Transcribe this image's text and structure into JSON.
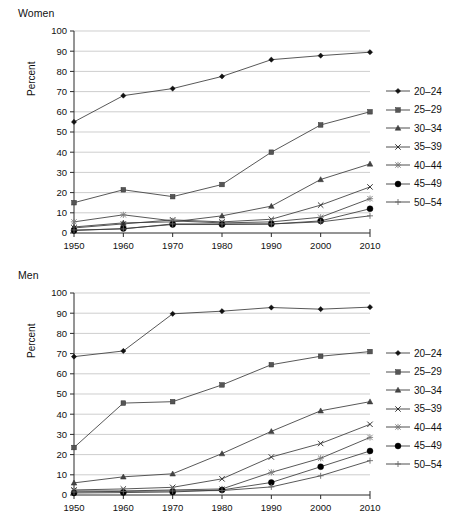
{
  "figure": {
    "background": "#ffffff",
    "line_color": "#3a3a3a",
    "grid_color": "#b9b9b9",
    "axis_color": "#2a2a2a"
  },
  "panels": [
    {
      "id": "women",
      "title": "Women",
      "chart_data": {
        "type": "line",
        "title": "Women",
        "xlabel": "",
        "ylabel": "Percent",
        "categories": [
          1950,
          1960,
          1970,
          1980,
          1990,
          2000,
          2010
        ],
        "xtick_labels": [
          "1950",
          "1960",
          "1970",
          "1980",
          "1990",
          "2000",
          "2010"
        ],
        "ytick_labels": [
          "0",
          "10",
          "20",
          "30",
          "40",
          "50",
          "60",
          "70",
          "80",
          "90",
          "100"
        ],
        "ylim": [
          0,
          100
        ],
        "ytick_step": 10,
        "grid": "horizontal",
        "legend_position": "right",
        "series": [
          {
            "name": "20–24",
            "marker": "diamond",
            "values": [
              55.0,
              68.0,
              71.5,
              77.5,
              85.8,
              87.8,
              89.5
            ]
          },
          {
            "name": "25–29",
            "marker": "square",
            "values": [
              15.0,
              21.4,
              18.0,
              24.0,
              40.0,
              53.5,
              60.0
            ]
          },
          {
            "name": "30–34",
            "marker": "triangle",
            "values": [
              3.0,
              5.0,
              5.5,
              8.5,
              13.3,
              26.5,
              34.2
            ]
          },
          {
            "name": "35–39",
            "marker": "cross",
            "values": [
              2.5,
              4.5,
              6.5,
              5.5,
              6.8,
              13.8,
              22.8
            ]
          },
          {
            "name": "40–44",
            "marker": "star",
            "values": [
              5.5,
              9.0,
              6.0,
              5.0,
              5.5,
              7.8,
              17.0
            ]
          },
          {
            "name": "45–49",
            "marker": "circle",
            "values": [
              1.2,
              2.2,
              4.2,
              4.2,
              4.4,
              6.0,
              12.0
            ]
          },
          {
            "name": "50–54",
            "marker": "plus",
            "values": [
              1.5,
              2.0,
              4.5,
              4.5,
              4.5,
              5.5,
              8.5
            ]
          }
        ]
      }
    },
    {
      "id": "men",
      "title": "Men",
      "chart_data": {
        "type": "line",
        "title": "Men",
        "xlabel": "",
        "ylabel": "Percent",
        "categories": [
          1950,
          1960,
          1970,
          1980,
          1990,
          2000,
          2010
        ],
        "xtick_labels": [
          "1950",
          "1960",
          "1970",
          "1980",
          "1990",
          "2000",
          "2010"
        ],
        "ytick_labels": [
          "0",
          "10",
          "20",
          "30",
          "40",
          "50",
          "60",
          "70",
          "80",
          "90",
          "100"
        ],
        "ylim": [
          0,
          100
        ],
        "ytick_step": 10,
        "grid": "horizontal",
        "legend_position": "right",
        "series": [
          {
            "name": "20–24",
            "marker": "diamond",
            "values": [
              68.5,
              71.3,
              89.7,
              91.0,
              92.8,
              92.0,
              93.0
            ]
          },
          {
            "name": "25–29",
            "marker": "square",
            "values": [
              23.5,
              45.5,
              46.2,
              54.5,
              64.5,
              68.7,
              71.0
            ]
          },
          {
            "name": "30–34",
            "marker": "triangle",
            "values": [
              6.0,
              9.0,
              10.5,
              20.5,
              31.5,
              41.7,
              46.2
            ]
          },
          {
            "name": "35–39",
            "marker": "cross",
            "values": [
              2.5,
              3.0,
              3.8,
              8.0,
              18.8,
              25.5,
              35.0
            ]
          },
          {
            "name": "40–44",
            "marker": "star",
            "values": [
              2.0,
              2.0,
              2.5,
              3.0,
              11.2,
              18.2,
              28.5
            ]
          },
          {
            "name": "45–49",
            "marker": "circle",
            "values": [
              1.0,
              1.2,
              1.5,
              2.5,
              6.2,
              14.0,
              21.8
            ]
          },
          {
            "name": "50–54",
            "marker": "plus",
            "values": [
              1.5,
              1.8,
              2.0,
              2.2,
              4.0,
              9.5,
              17.0
            ]
          }
        ]
      }
    }
  ],
  "legend": {
    "entries": [
      {
        "label": "20–24",
        "marker": "diamond"
      },
      {
        "label": "25–29",
        "marker": "square"
      },
      {
        "label": "30–34",
        "marker": "triangle"
      },
      {
        "label": "35–39",
        "marker": "cross"
      },
      {
        "label": "40–44",
        "marker": "star"
      },
      {
        "label": "45–49",
        "marker": "circle"
      },
      {
        "label": "50–54",
        "marker": "plus"
      }
    ]
  }
}
